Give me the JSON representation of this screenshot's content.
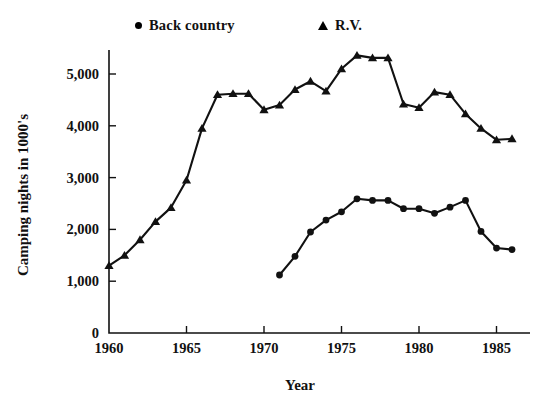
{
  "legend": {
    "items": [
      {
        "label": "Back country",
        "marker": "dot-marker-icon"
      },
      {
        "label": "R.V.",
        "marker": "triangle-marker-icon"
      }
    ]
  },
  "axes": {
    "x_title": "Year",
    "y_title": "Camping nights in 1000's",
    "x_ticks": [
      "1960",
      "1965",
      "1970",
      "1975",
      "1980",
      "1985"
    ],
    "y_ticks": [
      "0",
      "1,000",
      "2,000",
      "3,000",
      "4,000",
      "5,000"
    ]
  },
  "chart_data": {
    "type": "line",
    "title": "",
    "xlabel": "Year",
    "ylabel": "Camping nights in 1000's",
    "xlim": [
      1960,
      1986
    ],
    "ylim": [
      0,
      5600
    ],
    "grid": false,
    "legend_position": "top",
    "x_ticks": [
      1960,
      1965,
      1970,
      1975,
      1980,
      1985
    ],
    "y_ticks": [
      0,
      1000,
      2000,
      3000,
      4000,
      5000
    ],
    "series": [
      {
        "name": "R.V.",
        "marker": "triangle",
        "x": [
          1960,
          1961,
          1962,
          1963,
          1964,
          1965,
          1966,
          1967,
          1968,
          1969,
          1970,
          1971,
          1972,
          1973,
          1974,
          1975,
          1976,
          1977,
          1978,
          1979,
          1980,
          1981,
          1982,
          1983,
          1984,
          1985,
          1986
        ],
        "values": [
          1300,
          1500,
          1800,
          2150,
          2420,
          2950,
          3950,
          4600,
          4620,
          4620,
          4310,
          4400,
          4700,
          4860,
          4670,
          5100,
          5360,
          5310,
          5310,
          4420,
          4350,
          4650,
          4600,
          4230,
          3950,
          3730,
          3750
        ]
      },
      {
        "name": "Back country",
        "marker": "dot",
        "x": [
          1971,
          1972,
          1973,
          1974,
          1975,
          1976,
          1977,
          1978,
          1979,
          1980,
          1981,
          1982,
          1983,
          1984,
          1985,
          1986
        ],
        "values": [
          1120,
          1480,
          1950,
          2180,
          2340,
          2590,
          2560,
          2560,
          2400,
          2400,
          2310,
          2430,
          2560,
          1960,
          1640,
          1610
        ]
      }
    ]
  }
}
